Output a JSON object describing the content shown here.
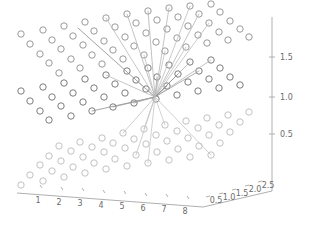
{
  "chart_data": {
    "type": "scatter",
    "title": "",
    "xlabel": "",
    "ylabel": "",
    "zlabel": "",
    "projection": "3d",
    "grid": false,
    "legend": null,
    "axes": {
      "x": {
        "ticks": [
          "1",
          "2",
          "3",
          "4",
          "5",
          "6",
          "7",
          "8"
        ],
        "values": [
          1,
          2,
          3,
          4,
          5,
          6,
          7,
          8
        ],
        "range": [
          0.5,
          8.5
        ]
      },
      "y": {
        "ticks": [
          "0.5",
          "1.0",
          "1.5",
          "2.0",
          "2.5"
        ],
        "values": [
          0.5,
          1.0,
          1.5,
          2.0,
          2.5
        ],
        "range": [
          0.25,
          2.75
        ]
      },
      "z": {
        "ticks": [
          "0.5",
          "1.0",
          "1.5"
        ],
        "values": [
          0.5,
          1.0,
          1.5
        ],
        "range": [
          0.25,
          1.85
        ]
      }
    },
    "marker": {
      "shape": "circle-open",
      "facecolor": "none",
      "edgecolor_top": "#9a9a9a",
      "edgecolor_middle": "#7d7d7d",
      "edgecolor_bottom": "#c2c2c2",
      "radius_px": 3.2
    },
    "hub": {
      "x_px": 155,
      "y_px": 97,
      "label": "center-node"
    },
    "layers": [
      {
        "name": "top-layer",
        "z": 1.5,
        "color": "#9a9a9a",
        "points_px": [
          [
            21,
            34
          ],
          [
            43,
            30
          ],
          [
            64,
            26
          ],
          [
            85,
            22
          ],
          [
            106,
            18
          ],
          [
            127,
            14
          ],
          [
            148,
            11
          ],
          [
            169,
            8
          ],
          [
            190,
            6
          ],
          [
            211,
            4
          ],
          [
            30,
            44
          ],
          [
            52,
            40
          ],
          [
            73,
            36
          ],
          [
            94,
            31
          ],
          [
            115,
            27
          ],
          [
            136,
            23
          ],
          [
            157,
            20
          ],
          [
            178,
            17
          ],
          [
            199,
            14
          ],
          [
            220,
            12
          ],
          [
            40,
            54
          ],
          [
            61,
            49
          ],
          [
            83,
            45
          ],
          [
            104,
            41
          ],
          [
            125,
            37
          ],
          [
            146,
            33
          ],
          [
            167,
            29
          ],
          [
            188,
            26
          ],
          [
            209,
            23
          ],
          [
            230,
            21
          ],
          [
            49,
            63
          ],
          [
            71,
            59
          ],
          [
            92,
            55
          ],
          [
            113,
            50
          ],
          [
            134,
            46
          ],
          [
            156,
            42
          ],
          [
            177,
            38
          ],
          [
            198,
            35
          ],
          [
            219,
            32
          ],
          [
            240,
            29
          ],
          [
            59,
            73
          ],
          [
            80,
            68
          ],
          [
            102,
            64
          ],
          [
            123,
            59
          ],
          [
            144,
            55
          ],
          [
            165,
            51
          ],
          [
            186,
            47
          ],
          [
            207,
            43
          ],
          [
            228,
            40
          ],
          [
            249,
            37
          ]
        ]
      },
      {
        "name": "middle-layer",
        "z": 1.0,
        "color": "#7d7d7d",
        "points_px": [
          [
            21,
            91
          ],
          [
            43,
            87
          ],
          [
            64,
            83
          ],
          [
            85,
            79
          ],
          [
            106,
            75
          ],
          [
            127,
            71
          ],
          [
            148,
            68
          ],
          [
            169,
            65
          ],
          [
            190,
            62
          ],
          [
            211,
            60
          ],
          [
            30,
            101
          ],
          [
            52,
            97
          ],
          [
            73,
            93
          ],
          [
            94,
            88
          ],
          [
            115,
            84
          ],
          [
            136,
            80
          ],
          [
            157,
            77
          ],
          [
            178,
            74
          ],
          [
            199,
            71
          ],
          [
            220,
            68
          ],
          [
            40,
            111
          ],
          [
            61,
            106
          ],
          [
            83,
            102
          ],
          [
            104,
            97
          ],
          [
            125,
            93
          ],
          [
            146,
            89
          ],
          [
            167,
            86
          ],
          [
            188,
            82
          ],
          [
            209,
            79
          ],
          [
            230,
            77
          ],
          [
            49,
            120
          ],
          [
            71,
            116
          ],
          [
            92,
            111
          ],
          [
            113,
            107
          ],
          [
            134,
            103
          ],
          [
            156,
            99
          ],
          [
            177,
            95
          ],
          [
            198,
            91
          ],
          [
            219,
            88
          ],
          [
            240,
            85
          ]
        ]
      },
      {
        "name": "bottom-layer",
        "z": 0.5,
        "color": "#c2c2c2",
        "points_px": [
          [
            21,
            185
          ],
          [
            43,
            181
          ],
          [
            64,
            177
          ],
          [
            85,
            173
          ],
          [
            106,
            169
          ],
          [
            127,
            166
          ],
          [
            148,
            163
          ],
          [
            169,
            160
          ],
          [
            190,
            157
          ],
          [
            211,
            155
          ],
          [
            30,
            175
          ],
          [
            52,
            171
          ],
          [
            73,
            167
          ],
          [
            94,
            163
          ],
          [
            115,
            159
          ],
          [
            136,
            155
          ],
          [
            157,
            152
          ],
          [
            178,
            149
          ],
          [
            199,
            146
          ],
          [
            220,
            143
          ],
          [
            40,
            165
          ],
          [
            61,
            161
          ],
          [
            83,
            157
          ],
          [
            104,
            152
          ],
          [
            125,
            148
          ],
          [
            146,
            144
          ],
          [
            167,
            141
          ],
          [
            188,
            138
          ],
          [
            209,
            135
          ],
          [
            230,
            132
          ],
          [
            49,
            156
          ],
          [
            71,
            151
          ],
          [
            92,
            147
          ],
          [
            113,
            143
          ],
          [
            134,
            139
          ],
          [
            156,
            135
          ],
          [
            177,
            131
          ],
          [
            198,
            128
          ],
          [
            219,
            125
          ],
          [
            240,
            122
          ],
          [
            59,
            146
          ],
          [
            80,
            142
          ],
          [
            102,
            138
          ],
          [
            123,
            133
          ],
          [
            144,
            129
          ],
          [
            165,
            125
          ],
          [
            186,
            121
          ],
          [
            207,
            118
          ],
          [
            228,
            115
          ],
          [
            249,
            112
          ]
        ]
      }
    ],
    "edges_px": [
      [
        155,
        97,
        78,
        28,
        "#8a8a8a"
      ],
      [
        155,
        97,
        106,
        18,
        "#b8b8b8"
      ],
      [
        155,
        97,
        127,
        14,
        "#b5b5b5"
      ],
      [
        155,
        97,
        148,
        11,
        "#b0b0b0"
      ],
      [
        155,
        97,
        169,
        8,
        "#b5b5b5"
      ],
      [
        155,
        97,
        190,
        6,
        "#bcbcbc"
      ],
      [
        155,
        97,
        199,
        14,
        "#b4b4b4"
      ],
      [
        155,
        97,
        209,
        23,
        "#bdbdbd"
      ],
      [
        155,
        97,
        186,
        47,
        "#c0c0c0"
      ],
      [
        155,
        97,
        211,
        60,
        "#b2b2b2"
      ],
      [
        155,
        97,
        190,
        62,
        "#b0b0b0"
      ],
      [
        155,
        97,
        199,
        71,
        "#9c9c9c"
      ],
      [
        155,
        97,
        178,
        74,
        "#8e8e8e"
      ],
      [
        155,
        97,
        167,
        86,
        "#8a8a8a"
      ],
      [
        155,
        97,
        157,
        77,
        "#a8a8a8"
      ],
      [
        155,
        97,
        136,
        80,
        "#b0b0b0"
      ],
      [
        155,
        97,
        106,
        75,
        "#b8b8b8"
      ],
      [
        155,
        97,
        92,
        111,
        "#8f8f8f"
      ],
      [
        155,
        97,
        113,
        107,
        "#9a9a9a"
      ],
      [
        155,
        97,
        134,
        103,
        "#a5a5a5"
      ],
      [
        155,
        97,
        123,
        133,
        "#c0c0c0"
      ],
      [
        155,
        97,
        144,
        129,
        "#c2c2c2"
      ],
      [
        155,
        97,
        136,
        155,
        "#c4c4c4"
      ],
      [
        155,
        97,
        148,
        163,
        "#c6c6c6"
      ],
      [
        155,
        97,
        211,
        155,
        "#c4c4c4"
      ],
      [
        155,
        97,
        165,
        125,
        "#c8c8c8"
      ],
      [
        155,
        97,
        165,
        51,
        "#c0c0c0"
      ],
      [
        155,
        97,
        144,
        55,
        "#bdbdbd"
      ]
    ]
  },
  "axis_lines": {
    "z_axis": {
      "x1": 272,
      "y1": 17,
      "x2": 272,
      "y2": 191
    },
    "x_axis": {
      "x1": 17,
      "y1": 193,
      "x2": 203,
      "y2": 207
    },
    "y_axis": {
      "x1": 203,
      "y1": 207,
      "x2": 272,
      "y2": 191
    }
  },
  "tick_marks": {
    "z": [
      {
        "label": "1.5",
        "x": 272,
        "y": 57
      },
      {
        "label": "1.0",
        "x": 272,
        "y": 97
      },
      {
        "label": "0.5",
        "x": 272,
        "y": 134
      }
    ],
    "x": [
      {
        "label": "1",
        "x": 38,
        "y": 194
      },
      {
        "label": "2",
        "x": 59,
        "y": 196
      },
      {
        "label": "3",
        "x": 80,
        "y": 197
      },
      {
        "label": "4",
        "x": 101,
        "y": 199
      },
      {
        "label": "5",
        "x": 122,
        "y": 200
      },
      {
        "label": "6",
        "x": 143,
        "y": 202
      },
      {
        "label": "7",
        "x": 164,
        "y": 203
      },
      {
        "label": "8",
        "x": 185,
        "y": 205
      }
    ],
    "y": [
      {
        "label": "0.5",
        "x": 216,
        "y": 203
      },
      {
        "label": "1.0",
        "x": 229,
        "y": 200
      },
      {
        "label": "1.5",
        "x": 242,
        "y": 196
      },
      {
        "label": "2.0",
        "x": 255,
        "y": 192
      },
      {
        "label": "2.5",
        "x": 268,
        "y": 188
      }
    ]
  },
  "colors": {
    "axis": "#b0b0b0",
    "tick_text": "#6b6b6b",
    "background": "#ffffff"
  }
}
